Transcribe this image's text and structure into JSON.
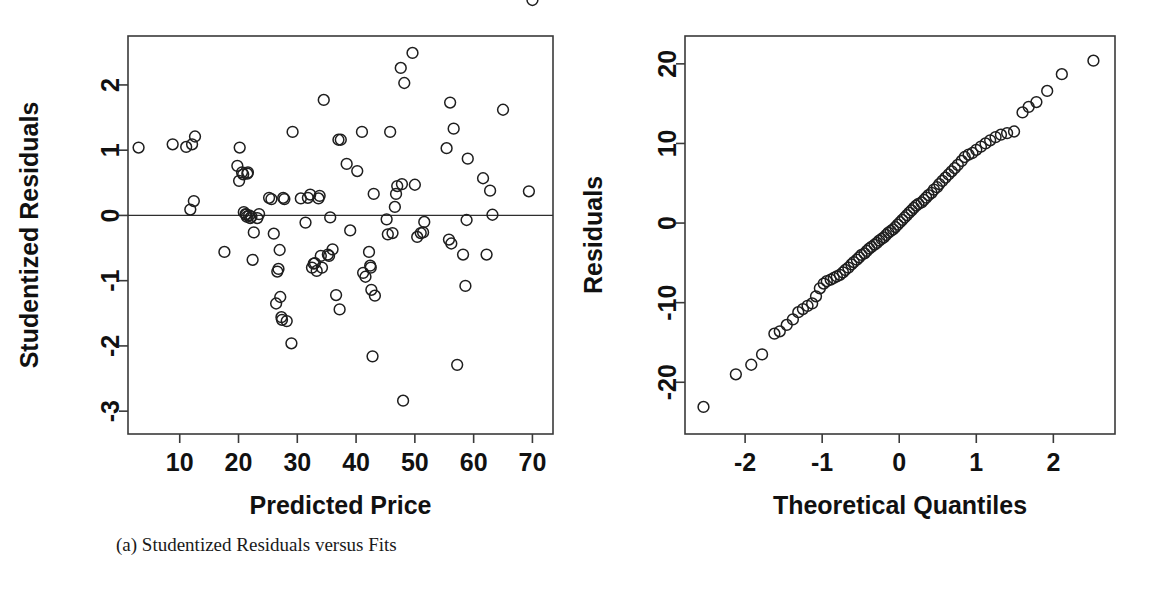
{
  "figure": {
    "background": "#ffffff",
    "point_color": "#1e1e1e",
    "axis_color": "#3a3a3a"
  },
  "panels": [
    {
      "id": "panel-a",
      "caption": "(a) Studentized Residuals versus Fits",
      "chart_data": {
        "type": "scatter",
        "title": "",
        "xlabel": "Predicted Price",
        "ylabel": "Studentized Residuals",
        "xlim": [
          1.2,
          73.5
        ],
        "ylim": [
          -3.35,
          2.75
        ],
        "xticks": [
          10,
          20,
          30,
          40,
          50,
          60,
          70
        ],
        "xticklabels": [
          "10",
          "20",
          "30",
          "40",
          "50",
          "60",
          "70"
        ],
        "yticks": [
          2,
          1,
          0,
          -1,
          -2,
          -3
        ],
        "yticklabels": [
          "2",
          "1",
          "0",
          "-1",
          "-2",
          "-3"
        ],
        "grid": false,
        "legend": "none",
        "annotations": [
          {
            "type": "hline",
            "y": 0,
            "label": "zero-reference-line"
          }
        ],
        "x": [
          3.0,
          8.8,
          11.1,
          12.1,
          12.6,
          11.8,
          12.4,
          17.6,
          19.8,
          20.1,
          20.2,
          20.6,
          20.8,
          20.9,
          21.2,
          21.3,
          21.4,
          21.5,
          21.6,
          21.8,
          22.0,
          22.2,
          22.4,
          22.6,
          23.2,
          23.5,
          25.2,
          25.6,
          26.0,
          26.4,
          26.6,
          26.8,
          27.0,
          27.1,
          27.3,
          27.4,
          27.6,
          27.8,
          28.2,
          29.0,
          29.2,
          30.6,
          31.4,
          31.8,
          32.2,
          32.5,
          32.8,
          33.0,
          33.3,
          33.6,
          33.8,
          34.0,
          34.2,
          34.5,
          35.2,
          35.4,
          35.6,
          36.0,
          36.6,
          37.0,
          37.2,
          37.4,
          38.4,
          39.0,
          40.2,
          41.0,
          41.2,
          41.6,
          42.2,
          42.4,
          42.5,
          42.6,
          42.8,
          43.0,
          43.2,
          45.2,
          45.4,
          45.8,
          46.2,
          46.6,
          46.8,
          47.0,
          47.6,
          47.8,
          48.0,
          48.2,
          49.6,
          50.0,
          50.4,
          51.0,
          51.4,
          51.6,
          55.4,
          55.8,
          56.0,
          56.2,
          56.6,
          57.2,
          58.2,
          58.6,
          58.8,
          59.0,
          61.6,
          62.2,
          62.8,
          63.2,
          65.0,
          69.4,
          70.0
        ],
        "y": [
          1.04,
          1.09,
          1.05,
          1.09,
          1.21,
          0.09,
          0.22,
          -0.56,
          0.76,
          0.53,
          1.04,
          0.66,
          0.63,
          0.05,
          0.02,
          0.01,
          -0.02,
          0.64,
          0.66,
          0.0,
          -0.04,
          -0.02,
          -0.68,
          -0.26,
          -0.04,
          0.02,
          0.27,
          0.25,
          -0.28,
          -1.35,
          -0.86,
          -0.82,
          -0.53,
          -1.25,
          -1.56,
          -1.6,
          0.27,
          0.25,
          -1.62,
          -1.96,
          1.28,
          0.26,
          -0.11,
          0.27,
          0.32,
          -0.8,
          -0.74,
          -0.73,
          -0.85,
          0.26,
          0.3,
          -0.62,
          -0.8,
          1.77,
          -0.6,
          -0.62,
          -0.03,
          -0.52,
          -1.22,
          1.16,
          -1.44,
          1.16,
          0.79,
          -0.23,
          0.68,
          1.28,
          -0.88,
          -0.94,
          -0.56,
          -0.77,
          -0.8,
          -1.14,
          -2.16,
          0.33,
          -1.23,
          -0.06,
          -0.29,
          1.28,
          -0.27,
          0.13,
          0.33,
          0.45,
          2.26,
          0.48,
          -2.84,
          2.03,
          2.49,
          0.47,
          -0.33,
          -0.27,
          -0.26,
          -0.1,
          1.03,
          -0.37,
          1.73,
          -0.43,
          1.33,
          -2.29,
          -0.6,
          -1.08,
          -0.07,
          0.87,
          0.57,
          -0.6,
          0.38,
          0.01,
          1.62,
          0.37
        ]
      }
    },
    {
      "id": "panel-b",
      "caption": "(b) Normal Plot of Residuals",
      "chart_data": {
        "type": "scatter",
        "title": "",
        "xlabel": "Theoretical Quantiles",
        "ylabel": "Residuals",
        "xlim": [
          -2.78,
          2.8
        ],
        "ylim": [
          -26.5,
          23.5
        ],
        "xticks": [
          -2,
          -1,
          0,
          1,
          2
        ],
        "xticklabels": [
          "-2",
          "-1",
          "0",
          "1",
          "2"
        ],
        "yticks": [
          20,
          10,
          0,
          -10,
          -20
        ],
        "yticklabels": [
          "20",
          "10",
          "0",
          "-10",
          "-20"
        ],
        "grid": false,
        "legend": "none",
        "x": [
          -2.54,
          -2.12,
          -1.92,
          -1.78,
          -1.62,
          -1.55,
          -1.46,
          -1.38,
          -1.31,
          -1.25,
          -1.19,
          -1.13,
          -1.08,
          -1.03,
          -0.98,
          -0.94,
          -0.89,
          -0.85,
          -0.81,
          -0.77,
          -0.73,
          -0.7,
          -0.66,
          -0.62,
          -0.59,
          -0.55,
          -0.52,
          -0.49,
          -0.45,
          -0.42,
          -0.39,
          -0.36,
          -0.32,
          -0.29,
          -0.26,
          -0.23,
          -0.2,
          -0.17,
          -0.14,
          -0.11,
          -0.08,
          -0.05,
          -0.02,
          0.01,
          0.04,
          0.07,
          0.1,
          0.13,
          0.16,
          0.19,
          0.22,
          0.25,
          0.29,
          0.32,
          0.35,
          0.38,
          0.42,
          0.45,
          0.49,
          0.52,
          0.56,
          0.6,
          0.64,
          0.68,
          0.72,
          0.76,
          0.81,
          0.85,
          0.9,
          0.95,
          1.0,
          1.06,
          1.12,
          1.18,
          1.25,
          1.32,
          1.4,
          1.49,
          1.6,
          1.68,
          1.78,
          1.92,
          2.11,
          2.52
        ],
        "y": [
          -23.1,
          -19.0,
          -17.8,
          -16.5,
          -13.9,
          -13.6,
          -12.8,
          -12.1,
          -11.2,
          -10.8,
          -10.4,
          -10.1,
          -9.2,
          -8.2,
          -7.6,
          -7.3,
          -7.1,
          -6.9,
          -6.7,
          -6.5,
          -6.2,
          -5.9,
          -5.6,
          -5.2,
          -4.9,
          -4.6,
          -4.3,
          -4.0,
          -3.8,
          -3.5,
          -3.2,
          -3.0,
          -2.7,
          -2.5,
          -2.2,
          -2.0,
          -1.8,
          -1.5,
          -1.2,
          -1.0,
          -0.8,
          -0.5,
          -0.2,
          0.1,
          0.4,
          0.7,
          1.0,
          1.3,
          1.6,
          1.9,
          2.2,
          2.4,
          2.6,
          2.9,
          3.2,
          3.5,
          3.8,
          4.2,
          4.5,
          4.9,
          5.3,
          5.7,
          6.1,
          6.5,
          6.9,
          7.3,
          7.8,
          8.3,
          8.6,
          8.8,
          9.2,
          9.6,
          10.0,
          10.4,
          10.8,
          11.1,
          11.3,
          11.5,
          13.9,
          14.6,
          15.2,
          16.6,
          18.7,
          20.4
        ]
      }
    }
  ]
}
